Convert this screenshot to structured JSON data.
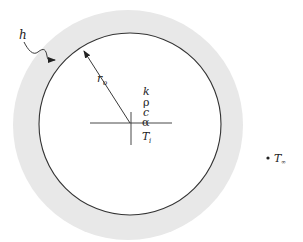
{
  "diagram": {
    "labels": {
      "h": "h",
      "r": "r",
      "r_sub": "o",
      "k": "k",
      "rho": "ρ",
      "c": "c",
      "alpha": "α",
      "T": "T",
      "T_sub": "i",
      "Tinf": "T",
      "Tinf_sub": "∞"
    },
    "colors": {
      "shell": "#e8e8e8",
      "line": "#333333",
      "text": "#222222"
    }
  }
}
